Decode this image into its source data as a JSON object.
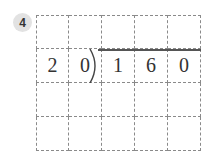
{
  "problem": {
    "number": "4",
    "type": "long-division",
    "divisor": [
      "2",
      "0"
    ],
    "dividend": [
      "1",
      "6",
      "0"
    ],
    "grid": {
      "rows": 4,
      "cols": 5,
      "cells": [
        [
          "",
          "",
          "",
          "",
          ""
        ],
        [
          "2",
          "0",
          "1",
          "6",
          "0"
        ],
        [
          "",
          "",
          "",
          "",
          ""
        ],
        [
          "",
          "",
          "",
          "",
          ""
        ]
      ]
    }
  }
}
